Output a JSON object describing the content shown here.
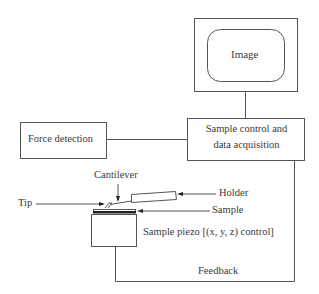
{
  "diagram": {
    "monitor": {
      "label": "Image"
    },
    "force_detection": {
      "label": "Force detection"
    },
    "sample_control": {
      "line1": "Sample control and",
      "line2": "data acquisition"
    },
    "cantilever": {
      "label": "Cantilever"
    },
    "holder": {
      "label": "Holder"
    },
    "tip": {
      "label": "Tip"
    },
    "sample": {
      "label": "Sample"
    },
    "piezo": {
      "label": "Sample piezo [(x, y, z) control]"
    },
    "feedback": {
      "label": "Feedback"
    }
  },
  "colors": {
    "stroke": "#555555",
    "text": "#3a3a3a",
    "sample_layer": "#222222"
  }
}
